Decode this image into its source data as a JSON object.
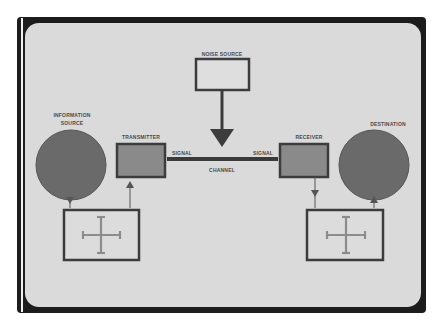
{
  "diagram": {
    "nodes": {
      "noise_source": {
        "label": "NOISE SOURCE"
      },
      "information_source": {
        "label_line1": "INFORMATION",
        "label_line2": "SOURCE"
      },
      "transmitter": {
        "label": "TRANSMITTER"
      },
      "receiver": {
        "label": "RECEIVER"
      },
      "destination": {
        "label": "DESTINATION"
      }
    },
    "channel": {
      "label": "CHANNEL",
      "signal_left": "SIGNAL",
      "signal_right": "SIGNAL"
    },
    "colors": {
      "background": "#ffffff",
      "frame_outer": "#1a1a1a",
      "panel": "#dcdcdc",
      "shape_fill": "#6e6e6e",
      "box_fill": "#8a8a8a",
      "stroke": "#3c3c3c",
      "cross": "#8c8c8c"
    }
  }
}
